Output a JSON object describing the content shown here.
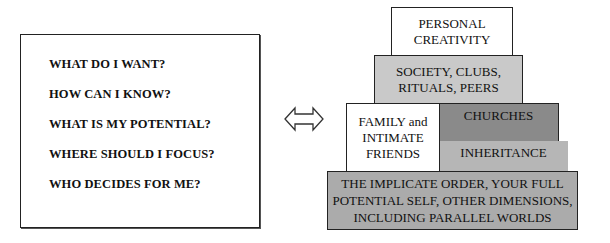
{
  "questions": {
    "items": [
      "WHAT DO I WANT?",
      "HOW CAN I KNOW?",
      "WHAT IS MY POTENTIAL?",
      "WHERE SHOULD I FOCUS?",
      "WHO DECIDES FOR ME?"
    ]
  },
  "connector": {
    "icon": "double-arrow-icon"
  },
  "pyramid": {
    "top": {
      "lines": [
        "PERSONAL",
        "CREATIVITY"
      ],
      "color": "#ffffff"
    },
    "society": {
      "lines": [
        "SOCIETY, CLUBS,",
        "RITUALS, PEERS"
      ],
      "color": "#c9c9c9"
    },
    "family": {
      "lines": [
        "FAMILY and",
        "INTIMATE",
        "FRIENDS"
      ],
      "color": "#ffffff"
    },
    "churches": {
      "lines": [
        "CHURCHES"
      ],
      "color": "#8a8a8a"
    },
    "inheritance": {
      "lines": [
        "INHERITANCE"
      ],
      "color": "#b6b6b6"
    },
    "base": {
      "lines": [
        "THE IMPLICATE ORDER, YOUR FULL",
        "POTENTIAL SELF, OTHER DIMENSIONS,",
        "INCLUDING PARALLEL WORLDS"
      ],
      "color": "#ababab"
    }
  }
}
